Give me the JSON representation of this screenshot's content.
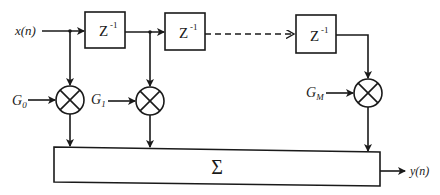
{
  "diagram": {
    "type": "FIR filter / tapped delay line block diagram",
    "input": {
      "label": "x(n)"
    },
    "output": {
      "label": "y(n)"
    },
    "delays": [
      {
        "label": "Z",
        "exponent": "-1"
      },
      {
        "label": "Z",
        "exponent": "-1"
      },
      {
        "label": "Z",
        "exponent": "-1"
      }
    ],
    "gains": [
      {
        "symbol": "G",
        "subscript": "0"
      },
      {
        "symbol": "G",
        "subscript": "1"
      },
      {
        "symbol": "G",
        "subscript": "M"
      }
    ],
    "summer": {
      "label": "Σ"
    },
    "colors": {
      "stroke": "#1a1a1a",
      "background": "#ffffff"
    }
  }
}
